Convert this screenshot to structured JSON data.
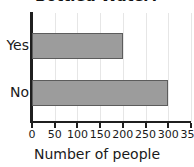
{
  "chart_data": {
    "type": "bar",
    "orientation": "horizontal",
    "title": "Bottled Water?",
    "xlabel": "Number of people",
    "ylabel": "",
    "categories": [
      "Yes",
      "No"
    ],
    "values": [
      200,
      300
    ],
    "xlim": [
      0,
      350
    ],
    "xticks": [
      0,
      50,
      100,
      150,
      200,
      250,
      300,
      350
    ],
    "xtick_labels": [
      "0",
      "50",
      "100",
      "150",
      "200",
      "250",
      "300",
      "350"
    ],
    "grid": true,
    "legend": false,
    "bar_color": "#9c9c9c",
    "bar_edge_color": "#5c5c5c",
    "axis_color": "#1f1f1f",
    "grid_color": "#e6e6e6",
    "background_color": "#ffffff"
  }
}
